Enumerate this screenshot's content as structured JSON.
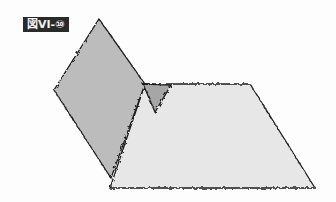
{
  "figure": {
    "label": "図VI-⑩"
  },
  "shapes": {
    "rhombus": {
      "fill": "#bcbcbc",
      "points": [
        [
          99,
          19
        ],
        [
          145,
          84
        ],
        [
          111,
          178
        ],
        [
          54,
          90
        ]
      ]
    },
    "trapezoid": {
      "fill": "#e7e7e7",
      "points": [
        [
          145,
          84
        ],
        [
          250,
          84
        ],
        [
          315,
          188
        ],
        [
          110,
          188
        ]
      ]
    },
    "triangle": {
      "fill": "#a6a6a6",
      "points": [
        [
          143,
          84
        ],
        [
          171,
          85
        ],
        [
          155,
          112
        ]
      ]
    },
    "stroke": "#1e1e1e"
  }
}
